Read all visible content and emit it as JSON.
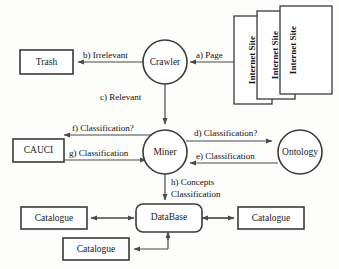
{
  "diagram": {
    "nodes": {
      "trash": {
        "label": "Trash",
        "shape": "rectangle"
      },
      "crawler": {
        "label": "Crawler",
        "shape": "circle"
      },
      "internet_site_1": {
        "label": "Internet Site",
        "shape": "rectangle"
      },
      "internet_site_2": {
        "label": "Internet Site",
        "shape": "rectangle"
      },
      "internet_site_3": {
        "label": "Internet Site",
        "shape": "rectangle"
      },
      "cauci": {
        "label": "CAUCI",
        "shape": "rectangle"
      },
      "miner": {
        "label": "Miner",
        "shape": "circle"
      },
      "ontology": {
        "label": "Ontology",
        "shape": "circle"
      },
      "database": {
        "label": "DataBase",
        "shape": "rounded-rectangle"
      },
      "catalogue_left": {
        "label": "Catalogue",
        "shape": "rectangle"
      },
      "catalogue_right": {
        "label": "Catalogue",
        "shape": "rectangle"
      },
      "catalogue_bottom": {
        "label": "Catalogue",
        "shape": "rectangle"
      }
    },
    "edges": {
      "a": {
        "label": "a) Page",
        "from": "internet_site_1",
        "to": "crawler"
      },
      "b": {
        "label": "b) Irrelevant",
        "from": "crawler",
        "to": "trash"
      },
      "c": {
        "label": "c) Relevant",
        "from": "crawler",
        "to": "miner"
      },
      "d": {
        "label": "d) Classification?",
        "from": "miner",
        "to": "ontology"
      },
      "e": {
        "label": "e) Classification",
        "from": "ontology",
        "to": "miner"
      },
      "f": {
        "label": "f) Classification?",
        "from": "miner",
        "to": "cauci"
      },
      "g": {
        "label": "g) Classification",
        "from": "cauci",
        "to": "miner"
      },
      "h_line1": {
        "label": "h) Concepts",
        "from": "miner",
        "to": "database"
      },
      "h_line2": {
        "label": "Classification",
        "from": "miner",
        "to": "database"
      }
    },
    "colors": {
      "stroke": "#3a3a3a",
      "edge": "#4a4a4a",
      "text": "#111111",
      "background": "#fdfdfc",
      "node_fill": "#ffffff"
    }
  }
}
